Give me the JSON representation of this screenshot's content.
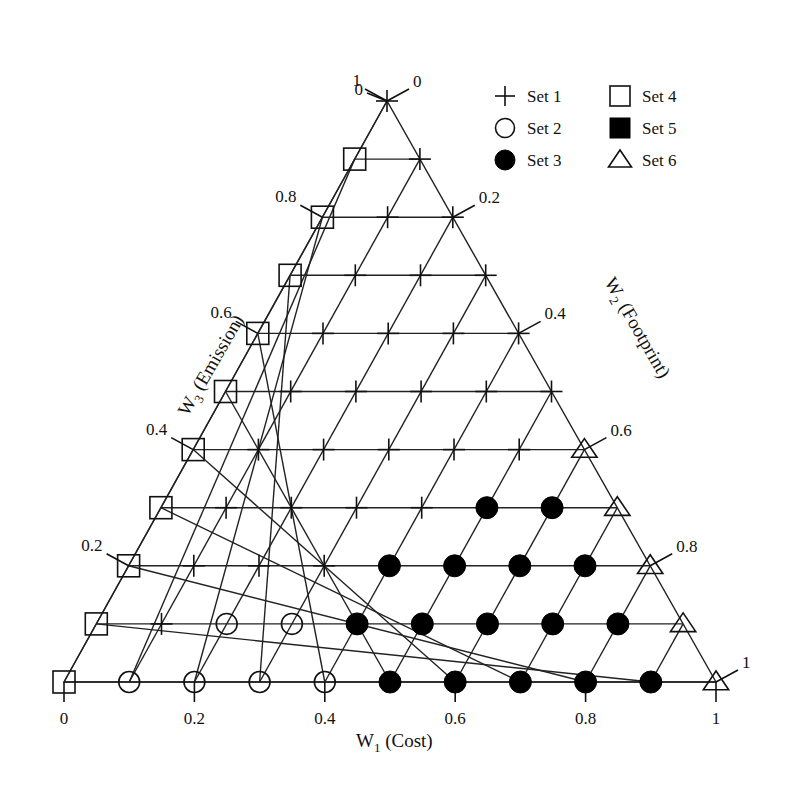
{
  "chart_data": {
    "type": "ternary-scatter",
    "title": "",
    "axes": {
      "w1": {
        "label": "W",
        "subscript": "1",
        "suffix": " (Cost)",
        "ticks": [
          "0",
          "0.2",
          "0.4",
          "0.6",
          "0.8",
          "1"
        ]
      },
      "w2": {
        "label": "W",
        "subscript": "2",
        "suffix": " (Footprint)",
        "ticks": [
          "0",
          "0.2",
          "0.4",
          "0.6",
          "0.8",
          "1"
        ]
      },
      "w3": {
        "label": "W",
        "subscript": "3",
        "suffix": " (Emission)",
        "ticks": [
          "0",
          "0.2",
          "0.4",
          "0.6",
          "0.8",
          "1"
        ]
      }
    },
    "divisions": 10,
    "legend": [
      {
        "set": 1,
        "label": "Set 1",
        "marker": "plus"
      },
      {
        "set": 2,
        "label": "Set 2",
        "marker": "open-circle"
      },
      {
        "set": 3,
        "label": "Set 3",
        "marker": "filled-circle"
      },
      {
        "set": 4,
        "label": "Set 4",
        "marker": "open-square"
      },
      {
        "set": 5,
        "label": "Set 5",
        "marker": "filled-square"
      },
      {
        "set": 6,
        "label": "Set 6",
        "marker": "open-triangle"
      }
    ],
    "legend_position": "top-right",
    "rows_note": "rows indexed by W3 = k/10 (k=0 bottom .. 10 top); each entry is set number for W1 = i/10 .. along row, W2 = 1-W1-W3",
    "rows": [
      [
        4,
        2,
        2,
        2,
        2,
        3,
        3,
        3,
        3,
        3,
        6
      ],
      [
        4,
        1,
        2,
        2,
        3,
        3,
        3,
        3,
        3,
        6
      ],
      [
        4,
        1,
        1,
        1,
        3,
        3,
        3,
        3,
        6
      ],
      [
        4,
        1,
        1,
        1,
        1,
        3,
        3,
        6
      ],
      [
        4,
        1,
        1,
        1,
        1,
        1,
        6
      ],
      [
        4,
        1,
        1,
        1,
        1,
        1
      ],
      [
        4,
        1,
        1,
        1,
        1
      ],
      [
        4,
        1,
        1,
        1
      ],
      [
        4,
        1,
        1
      ],
      [
        4,
        1
      ],
      [
        1
      ]
    ]
  }
}
